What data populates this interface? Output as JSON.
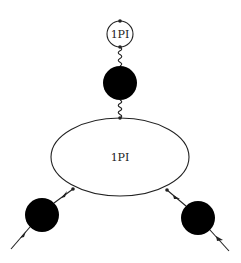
{
  "diagram": {
    "type": "feynman-diagram",
    "colors": {
      "stroke": "#222222",
      "blob": "#000000",
      "background": "#ffffff"
    },
    "nodes": [
      {
        "id": "tadpole-1pi",
        "shape": "circle",
        "label": "1PI",
        "fill": "none"
      },
      {
        "id": "propagator-blob-top",
        "shape": "filled-circle",
        "label": ""
      },
      {
        "id": "vertex-1pi",
        "shape": "ellipse",
        "label": "1PI",
        "fill": "none"
      },
      {
        "id": "propagator-blob-left",
        "shape": "filled-circle",
        "label": ""
      },
      {
        "id": "propagator-blob-right",
        "shape": "filled-circle",
        "label": ""
      }
    ],
    "edges": [
      {
        "from": "tadpole-1pi",
        "to": "propagator-blob-top",
        "style": "wavy"
      },
      {
        "from": "propagator-blob-top",
        "to": "vertex-1pi",
        "style": "wavy"
      },
      {
        "from": "vertex-1pi",
        "to": "propagator-blob-left",
        "style": "fermion-arrow",
        "direction": "out"
      },
      {
        "from": "propagator-blob-left",
        "to": "external-left",
        "style": "fermion-arrow",
        "direction": "out"
      },
      {
        "from": "propagator-blob-right",
        "to": "vertex-1pi",
        "style": "fermion-arrow",
        "direction": "in"
      },
      {
        "from": "external-right",
        "to": "propagator-blob-right",
        "style": "fermion-arrow",
        "direction": "in"
      }
    ],
    "labels": {
      "tadpole": "1PI",
      "vertex": "1PI"
    }
  }
}
